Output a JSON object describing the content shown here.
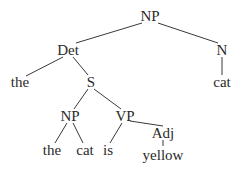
{
  "tree": {
    "nodes": [
      {
        "id": "np_root",
        "label": "NP",
        "x": 150,
        "y": 16
      },
      {
        "id": "det",
        "label": "Det",
        "x": 68,
        "y": 50
      },
      {
        "id": "n",
        "label": "N",
        "x": 222,
        "y": 50
      },
      {
        "id": "the1",
        "label": "the",
        "x": 20,
        "y": 82
      },
      {
        "id": "s",
        "label": "S",
        "x": 91,
        "y": 82
      },
      {
        "id": "cat1",
        "label": "cat",
        "x": 222,
        "y": 82
      },
      {
        "id": "np_inner",
        "label": "NP",
        "x": 70,
        "y": 116
      },
      {
        "id": "vp",
        "label": "VP",
        "x": 125,
        "y": 116
      },
      {
        "id": "the2",
        "label": "the",
        "x": 52,
        "y": 150
      },
      {
        "id": "cat2",
        "label": "cat",
        "x": 85,
        "y": 150
      },
      {
        "id": "is",
        "label": "is",
        "x": 108,
        "y": 150
      },
      {
        "id": "adj",
        "label": "Adj",
        "x": 163,
        "y": 133
      },
      {
        "id": "yellow",
        "label": "yellow",
        "x": 163,
        "y": 155
      }
    ],
    "edges": [
      {
        "x1": 142,
        "y1": 23,
        "x2": 76,
        "y2": 43
      },
      {
        "x1": 158,
        "y1": 23,
        "x2": 218,
        "y2": 43
      },
      {
        "x1": 63,
        "y1": 57,
        "x2": 26,
        "y2": 76
      },
      {
        "x1": 73,
        "y1": 57,
        "x2": 88,
        "y2": 75
      },
      {
        "x1": 222,
        "y1": 57,
        "x2": 222,
        "y2": 75
      },
      {
        "x1": 88,
        "y1": 89,
        "x2": 74,
        "y2": 109
      },
      {
        "x1": 94,
        "y1": 89,
        "x2": 121,
        "y2": 109
      },
      {
        "x1": 67,
        "y1": 123,
        "x2": 55,
        "y2": 143
      },
      {
        "x1": 73,
        "y1": 123,
        "x2": 83,
        "y2": 143
      },
      {
        "x1": 122,
        "y1": 123,
        "x2": 110,
        "y2": 143
      },
      {
        "x1": 130,
        "y1": 121,
        "x2": 163,
        "y2": 126
      },
      {
        "x1": 163,
        "y1": 140,
        "x2": 163,
        "y2": 146
      }
    ]
  }
}
